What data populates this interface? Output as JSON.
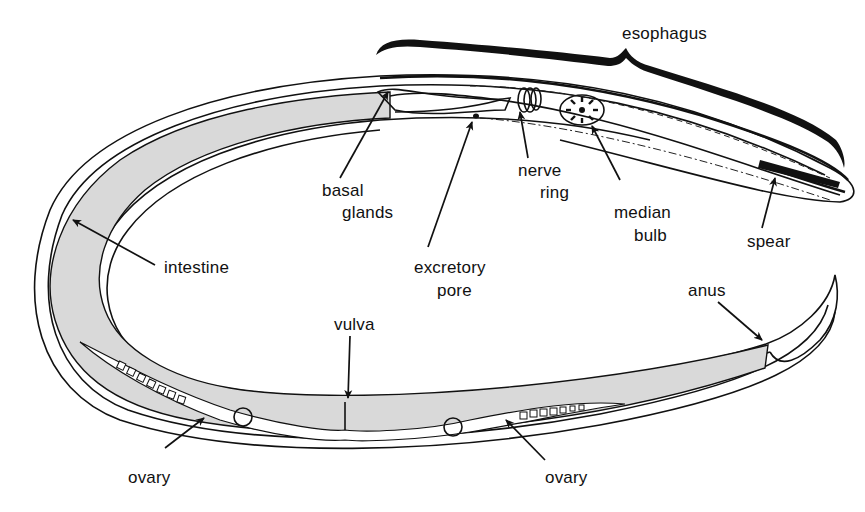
{
  "diagram": {
    "colors": {
      "outline": "#111111",
      "intestine_fill": "#d9d9d9",
      "background": "#ffffff"
    },
    "labels": {
      "esophagus": "esophagus",
      "basal_glands_line1": "basal",
      "basal_glands_line2": "glands",
      "nerve_ring_line1": "nerve",
      "nerve_ring_line2": "ring",
      "median_bulb_line1": "median",
      "median_bulb_line2": "bulb",
      "spear": "spear",
      "intestine": "intestine",
      "excretory_pore_line1": "excretory",
      "excretory_pore_line2": "pore",
      "anus": "anus",
      "vulva": "vulva",
      "ovary_left": "ovary",
      "ovary_right": "ovary"
    }
  }
}
